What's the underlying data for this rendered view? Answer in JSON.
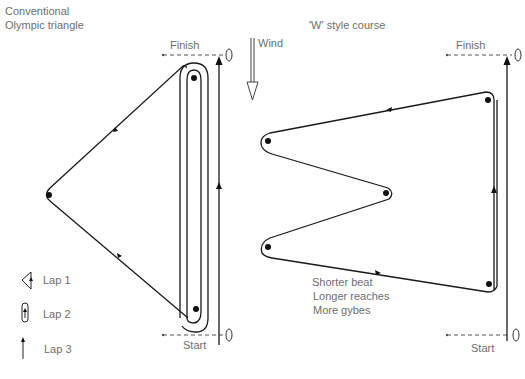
{
  "left_diagram": {
    "title_line1": "Conventional",
    "title_line2": "Olympic triangle",
    "finish_label": "Finish",
    "start_label": "Start",
    "legend": [
      {
        "icon": "triangle-lap-icon",
        "label": "Lap 1"
      },
      {
        "icon": "sausage-lap-icon",
        "label": "Lap 2"
      },
      {
        "icon": "beat-arrow-icon",
        "label": "Lap 3"
      }
    ]
  },
  "wind": {
    "label": "Wind",
    "direction": "down"
  },
  "right_diagram": {
    "title": "'W' style course",
    "finish_label": "Finish",
    "start_label": "Start",
    "notes": [
      "Shorter beat",
      "Longer reaches",
      "More gybes"
    ]
  },
  "colors": {
    "line": "#1a1a1a",
    "text": "#6e6e6e",
    "background": "#ffffff"
  }
}
